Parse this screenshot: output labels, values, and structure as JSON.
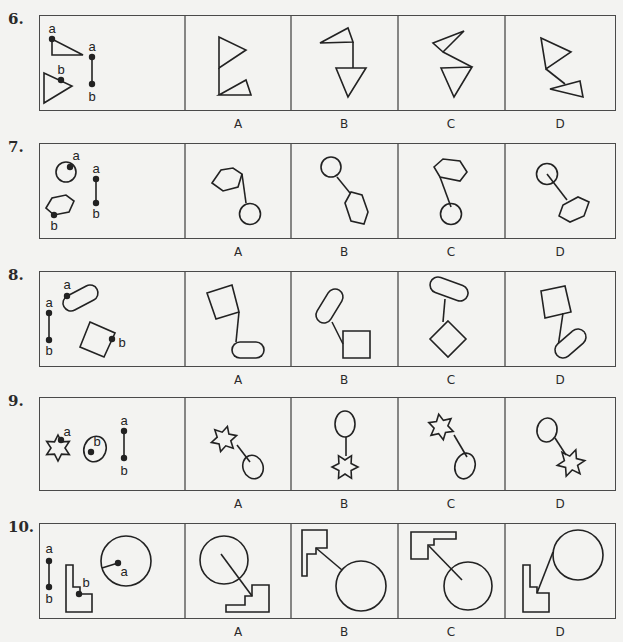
{
  "page": {
    "background": "#f3f3f1",
    "line_color": "#222222",
    "border_color": "#4a4a4a"
  },
  "option_labels": [
    "A",
    "B",
    "C",
    "D"
  ],
  "questions": [
    {
      "number": "6.",
      "box": {
        "top": 15,
        "bottom": 110
      },
      "label_y": 117,
      "stem": {
        "shapes": [
          {
            "type": "polygon",
            "points": "52,39 52,55 83,55"
          },
          {
            "type": "polygon",
            "points": "44,73 44,103 72,86"
          },
          {
            "type": "line",
            "x1": 92,
            "y1": 57,
            "x2": 92,
            "y2": 84
          }
        ],
        "dots": [
          [
            52,
            39
          ],
          [
            61,
            80
          ],
          [
            92,
            57
          ],
          [
            92,
            84
          ]
        ],
        "labels": [
          {
            "text": "a",
            "x": 52,
            "y": 33
          },
          {
            "text": "b",
            "x": 61,
            "y": 74
          },
          {
            "text": "a",
            "x": 92,
            "y": 51
          },
          {
            "text": "b",
            "x": 92,
            "y": 101
          }
        ]
      },
      "options": [
        {
          "label": "A",
          "shapes": [
            {
              "type": "polygon",
              "points": "219,37 219,68 246,50"
            },
            {
              "type": "line",
              "x1": 219,
              "y1": 68,
              "x2": 219,
              "y2": 95
            },
            {
              "type": "polygon",
              "points": "219,95 246,80 251,95"
            }
          ]
        },
        {
          "label": "B",
          "shapes": [
            {
              "type": "polygon",
              "points": "320,43 348,28 353,42"
            },
            {
              "type": "line",
              "x1": 353,
              "y1": 42,
              "x2": 353,
              "y2": 68
            },
            {
              "type": "polygon",
              "points": "336,68 366,68 348,97"
            }
          ]
        },
        {
          "label": "C",
          "shapes": [
            {
              "type": "polygon",
              "points": "433,43 464,31 443,52"
            },
            {
              "type": "line",
              "x1": 443,
              "y1": 52,
              "x2": 472,
              "y2": 67
            },
            {
              "type": "polygon",
              "points": "441,68 472,67 454,97"
            }
          ]
        },
        {
          "label": "D",
          "shapes": [
            {
              "type": "polygon",
              "points": "541,38 571,52 546,69"
            },
            {
              "type": "line",
              "x1": 546,
              "y1": 69,
              "x2": 565,
              "y2": 84
            },
            {
              "type": "polygon",
              "points": "550,89 580,81 583,97"
            }
          ]
        }
      ]
    },
    {
      "number": "7.",
      "box": {
        "top": 143,
        "bottom": 238
      },
      "label_y": 245,
      "stem": {
        "shapes": [
          {
            "type": "circle",
            "cx": 66,
            "cy": 172,
            "r": 10
          },
          {
            "type": "polygon",
            "points": "46,208 52,198 66,195 74,201 69,212 54,215"
          },
          {
            "type": "line",
            "x1": 96,
            "y1": 179,
            "x2": 96,
            "y2": 203
          }
        ],
        "dots": [
          [
            70,
            167
          ],
          [
            54,
            215
          ],
          [
            96,
            179
          ],
          [
            96,
            203
          ]
        ],
        "labels": [
          {
            "text": "a",
            "x": 76,
            "y": 160
          },
          {
            "text": "b",
            "x": 54,
            "y": 230
          },
          {
            "text": "a",
            "x": 96,
            "y": 173
          },
          {
            "text": "b",
            "x": 96,
            "y": 218
          }
        ]
      },
      "options": [
        {
          "label": "A",
          "shapes": [
            {
              "type": "polygon",
              "points": "212,183 221,170 233,168 242,174 238,187 223,191"
            },
            {
              "type": "line",
              "x1": 242,
              "y1": 174,
              "x2": 246,
              "y2": 203
            },
            {
              "type": "circle",
              "cx": 250,
              "cy": 214,
              "r": 10.5
            }
          ]
        },
        {
          "label": "B",
          "shapes": [
            {
              "type": "circle",
              "cx": 331,
              "cy": 167,
              "r": 10
            },
            {
              "type": "line",
              "x1": 337,
              "y1": 177,
              "x2": 350,
              "y2": 193
            },
            {
              "type": "polygon",
              "points": "345,203 351,192 362,195 368,212 364,224 351,221"
            }
          ]
        },
        {
          "label": "C",
          "shapes": [
            {
              "type": "polygon",
              "points": "434,167 443,159 460,161 467,172 460,181 440,177"
            },
            {
              "type": "line",
              "x1": 440,
              "y1": 177,
              "x2": 451,
              "y2": 207
            },
            {
              "type": "circle",
              "cx": 451,
              "cy": 214,
              "r": 10.5
            }
          ]
        },
        {
          "label": "D",
          "shapes": [
            {
              "type": "circle",
              "cx": 547,
              "cy": 174,
              "r": 10.5
            },
            {
              "type": "line",
              "x1": 547,
              "y1": 174,
              "x2": 567,
              "y2": 200
            },
            {
              "type": "polygon",
              "points": "559,216 563,205 578,197 589,202 584,216 570,222"
            }
          ]
        }
      ]
    },
    {
      "number": "8.",
      "box": {
        "top": 271,
        "bottom": 366
      },
      "label_y": 373,
      "stem": {
        "shapes": [
          {
            "type": "line",
            "x1": 49,
            "y1": 313,
            "x2": 49,
            "y2": 340
          },
          {
            "type": "capsule",
            "x1": 71,
            "y1": 303,
            "x2": 90,
            "y2": 293,
            "r": 8
          },
          {
            "type": "polygon",
            "points": "90,322 115,333 104,357 80,347"
          }
        ],
        "dots": [
          [
            49,
            313
          ],
          [
            49,
            340
          ],
          [
            67,
            296
          ],
          [
            112,
            339
          ]
        ],
        "labels": [
          {
            "text": "a",
            "x": 49,
            "y": 307
          },
          {
            "text": "b",
            "x": 49,
            "y": 355
          },
          {
            "text": "a",
            "x": 67,
            "y": 289
          },
          {
            "text": "b",
            "x": 122,
            "y": 347
          }
        ]
      },
      "options": [
        {
          "label": "A",
          "shapes": [
            {
              "type": "polygon",
              "points": "207,293 232,285 239,312 216,319"
            },
            {
              "type": "line",
              "x1": 239,
              "y1": 312,
              "x2": 236,
              "y2": 342
            },
            {
              "type": "capsule",
              "x1": 240,
              "y1": 350,
              "x2": 256,
              "y2": 350,
              "r": 8
            }
          ]
        },
        {
          "label": "B",
          "shapes": [
            {
              "type": "capsule",
              "x1": 335,
              "y1": 297,
              "x2": 324,
              "y2": 315,
              "r": 8
            },
            {
              "type": "line",
              "x1": 332,
              "y1": 322,
              "x2": 343,
              "y2": 344
            },
            {
              "type": "polygon",
              "points": "343,331 370,331 370,358 343,358"
            }
          ]
        },
        {
          "label": "C",
          "shapes": [
            {
              "type": "capsule",
              "x1": 438,
              "y1": 285,
              "x2": 460,
              "y2": 293,
              "r": 8
            },
            {
              "type": "line",
              "x1": 445,
              "y1": 299,
              "x2": 443,
              "y2": 322
            },
            {
              "type": "polygon",
              "points": "448,321 466,339 448,357 430,339"
            }
          ]
        },
        {
          "label": "D",
          "shapes": [
            {
              "type": "polygon",
              "points": "541,291 565,286 571,312 545,318"
            },
            {
              "type": "line",
              "x1": 563,
              "y1": 313,
              "x2": 558,
              "y2": 347
            },
            {
              "type": "capsule",
              "x1": 563,
              "y1": 350,
              "x2": 578,
              "y2": 337,
              "r": 8
            }
          ]
        }
      ]
    },
    {
      "number": "9.",
      "box": {
        "top": 397,
        "bottom": 490
      },
      "label_y": 497,
      "stem": {
        "shapes": [
          {
            "type": "star",
            "cx": 58,
            "cy": 448,
            "r": 13,
            "ir": 7,
            "n": 6,
            "rot": 0
          },
          {
            "type": "ellipse",
            "cx": 95,
            "cy": 449,
            "rx": 11,
            "ry": 13,
            "rot": 20
          },
          {
            "type": "line",
            "x1": 124,
            "y1": 431,
            "x2": 124,
            "y2": 458
          }
        ],
        "dots": [
          [
            61,
            440
          ],
          [
            91,
            452
          ],
          [
            124,
            431
          ],
          [
            124,
            458
          ]
        ],
        "labels": [
          {
            "text": "a",
            "x": 67,
            "y": 436
          },
          {
            "text": "b",
            "x": 97,
            "y": 446
          },
          {
            "text": "a",
            "x": 124,
            "y": 425
          },
          {
            "text": "b",
            "x": 124,
            "y": 475
          }
        ]
      },
      "options": [
        {
          "label": "A",
          "shapes": [
            {
              "type": "star",
              "cx": 224,
              "cy": 439,
              "r": 13,
              "ir": 7,
              "n": 6,
              "rot": 15
            },
            {
              "type": "line",
              "x1": 237,
              "y1": 445,
              "x2": 250,
              "y2": 462
            },
            {
              "type": "ellipse",
              "cx": 253,
              "cy": 467,
              "rx": 10,
              "ry": 12,
              "rot": -20
            }
          ]
        },
        {
          "label": "B",
          "shapes": [
            {
              "type": "ellipse",
              "cx": 345,
              "cy": 424,
              "rx": 10,
              "ry": 13,
              "rot": 0
            },
            {
              "type": "line",
              "x1": 346,
              "y1": 437,
              "x2": 346,
              "y2": 456
            },
            {
              "type": "star",
              "cx": 345,
              "cy": 467,
              "r": 13,
              "ir": 7,
              "n": 6,
              "rot": 30
            }
          ]
        },
        {
          "label": "C",
          "shapes": [
            {
              "type": "star",
              "cx": 441,
              "cy": 427,
              "r": 13,
              "ir": 7,
              "n": 6,
              "rot": -10
            },
            {
              "type": "line",
              "x1": 454,
              "y1": 435,
              "x2": 467,
              "y2": 457
            },
            {
              "type": "ellipse",
              "cx": 465,
              "cy": 466,
              "rx": 10,
              "ry": 13,
              "rot": 15
            }
          ]
        },
        {
          "label": "D",
          "shapes": [
            {
              "type": "ellipse",
              "cx": 547,
              "cy": 430,
              "rx": 10,
              "ry": 12,
              "rot": 10
            },
            {
              "type": "line",
              "x1": 555,
              "y1": 438,
              "x2": 566,
              "y2": 455
            },
            {
              "type": "star",
              "cx": 571,
              "cy": 463,
              "r": 14,
              "ir": 7,
              "n": 6,
              "rot": 20
            }
          ]
        }
      ]
    },
    {
      "number": "10.",
      "box": {
        "top": 523,
        "bottom": 618
      },
      "label_y": 625,
      "stem": {
        "shapes": [
          {
            "type": "line",
            "x1": 49,
            "y1": 561,
            "x2": 49,
            "y2": 587
          },
          {
            "type": "polygon",
            "points": "66,565 73,565 73,587 80,587 80,594 92,594 92,612 66,612"
          },
          {
            "type": "circle",
            "cx": 126,
            "cy": 561,
            "r": 25
          },
          {
            "type": "line",
            "x1": 118,
            "y1": 563,
            "x2": 102,
            "y2": 568
          }
        ],
        "dots": [
          [
            49,
            561
          ],
          [
            49,
            587
          ],
          [
            79,
            594
          ],
          [
            118,
            563
          ]
        ],
        "labels": [
          {
            "text": "a",
            "x": 49,
            "y": 553
          },
          {
            "text": "b",
            "x": 49,
            "y": 603
          },
          {
            "text": "b",
            "x": 86,
            "y": 587
          },
          {
            "text": "a",
            "x": 124,
            "y": 576
          }
        ]
      },
      "options": [
        {
          "label": "A",
          "shapes": [
            {
              "type": "circle",
              "cx": 224,
              "cy": 560,
              "r": 24
            },
            {
              "type": "line",
              "x1": 221,
              "y1": 554,
              "x2": 252,
              "y2": 596
            },
            {
              "type": "polygon",
              "points": "226,612 226,605 245,605 245,596 252,596 252,585 269,585 269,612"
            }
          ]
        },
        {
          "label": "B",
          "shapes": [
            {
              "type": "polygon",
              "points": "302,530 327,530 327,548 316,548 316,554 307,554 307,576 302,576"
            },
            {
              "type": "line",
              "x1": 316,
              "y1": 548,
              "x2": 342,
              "y2": 570
            },
            {
              "type": "circle",
              "cx": 361,
              "cy": 586,
              "r": 25
            }
          ]
        },
        {
          "label": "C",
          "shapes": [
            {
              "type": "polygon",
              "points": "411,532 456,532 456,539 434,539 434,545 428,545 428,559 411,559"
            },
            {
              "type": "line",
              "x1": 429,
              "y1": 546,
              "x2": 462,
              "y2": 580
            },
            {
              "type": "circle",
              "cx": 468,
              "cy": 586,
              "r": 24
            }
          ]
        },
        {
          "label": "D",
          "shapes": [
            {
              "type": "circle",
              "cx": 578,
              "cy": 555,
              "r": 25
            },
            {
              "type": "line",
              "x1": 553,
              "y1": 552,
              "x2": 537,
              "y2": 593
            },
            {
              "type": "polygon",
              "points": "523,565 530,565 530,587 537,587 537,593 549,593 549,612 523,612"
            }
          ]
        }
      ]
    }
  ],
  "layout": {
    "box_left": 39,
    "box_right": 616,
    "dividers": [
      185,
      291,
      398,
      505
    ],
    "option_centers": [
      238,
      344,
      451,
      560
    ],
    "number_x": 8
  }
}
